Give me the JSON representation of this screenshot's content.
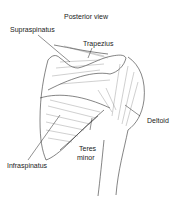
{
  "diagram": {
    "title": "Posterior view",
    "labels": {
      "supraspinatus": "Supraspinatus",
      "trapezius": "Trapezius",
      "deltoid": "Deltoid",
      "teres_minor_line1": "Teres",
      "teres_minor_line2": "minor",
      "infraspinatus": "Infraspinatus"
    }
  }
}
